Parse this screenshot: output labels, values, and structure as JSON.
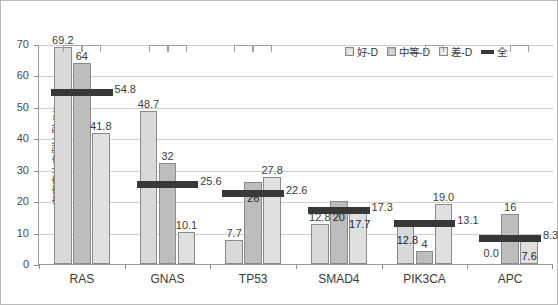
{
  "chart_data": {
    "type": "bar",
    "title": "",
    "xlabel": "",
    "ylabel": "有突变的病例比例 (%)",
    "ylim": [
      0,
      70
    ],
    "yticks": [
      0,
      10,
      20,
      30,
      40,
      50,
      60,
      70
    ],
    "ytick_labels": [
      "0",
      "10",
      "20",
      "30",
      "40",
      "50",
      "60",
      "70"
    ],
    "grid": "horizontal",
    "legend_position": "top-right",
    "categories": [
      "RAS",
      "GNAS",
      "TP53",
      "SMAD4",
      "PIK3CA",
      "APC"
    ],
    "series": [
      {
        "name": "好-D",
        "color": "#d9d9d9",
        "values": [
          69.2,
          48.7,
          7.7,
          12.8,
          12.8,
          0.0
        ],
        "labels": [
          "69.2",
          "48.7",
          "7.7",
          "12.8",
          "12.8",
          "0.0"
        ]
      },
      {
        "name": "中等-D",
        "color": "#bdbdbd",
        "values": [
          64,
          32,
          26,
          20,
          4,
          16
        ],
        "labels": [
          "64",
          "32",
          "26",
          "20",
          "4",
          "16"
        ]
      },
      {
        "name": "差-D",
        "color": "#e0e0e0",
        "values": [
          41.8,
          10.1,
          27.8,
          17.7,
          19.0,
          7.6
        ],
        "labels": [
          "41.8",
          "10.1",
          "27.8",
          "17.7",
          "19.0",
          "7.6"
        ]
      }
    ],
    "overall_series": {
      "name": "全",
      "color": "#383838",
      "values": [
        54.8,
        25.6,
        22.6,
        17.3,
        13.1,
        8.3
      ],
      "labels": [
        "54.8",
        "25.6",
        "22.6",
        "17.3",
        "13.1",
        "8.3"
      ]
    },
    "significance_brackets": {
      "RAS": 3,
      "GNAS": 3,
      "TP53": 3,
      "SMAD4": 0,
      "PIK3CA": 1,
      "APC": 1
    }
  },
  "legend": {
    "items": [
      {
        "label": "好-D",
        "kind": "swatch",
        "style": "s0"
      },
      {
        "label": "中等-D",
        "kind": "swatch",
        "style": "s1"
      },
      {
        "label": "差-D",
        "kind": "swatch",
        "style": "s2"
      },
      {
        "label": "全",
        "kind": "line",
        "style": "all"
      }
    ]
  }
}
